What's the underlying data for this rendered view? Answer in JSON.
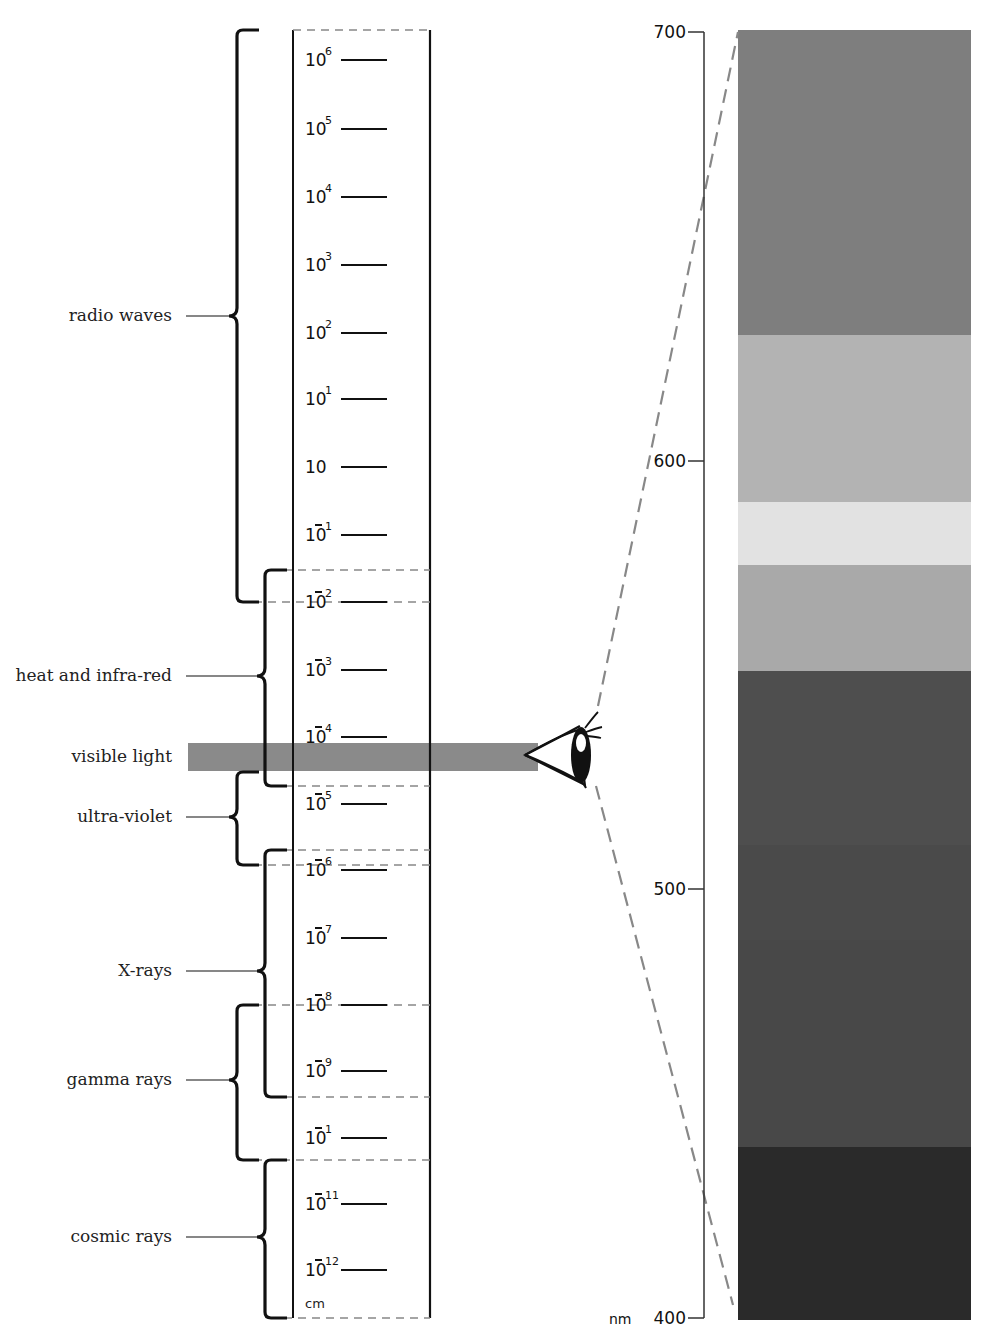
{
  "scale": {
    "unit": "cm",
    "ticks": [
      {
        "base": "10",
        "exp": "6",
        "neg": false,
        "y": 60
      },
      {
        "base": "10",
        "exp": "5",
        "neg": false,
        "y": 129
      },
      {
        "base": "10",
        "exp": "4",
        "neg": false,
        "y": 197
      },
      {
        "base": "10",
        "exp": "3",
        "neg": false,
        "y": 265
      },
      {
        "base": "10",
        "exp": "2",
        "neg": false,
        "y": 333
      },
      {
        "base": "10",
        "exp": "1",
        "neg": false,
        "y": 399
      },
      {
        "base": "10",
        "exp": "",
        "neg": false,
        "y": 467
      },
      {
        "base": "10",
        "exp": "1",
        "neg": true,
        "y": 535
      },
      {
        "base": "10",
        "exp": "2",
        "neg": true,
        "y": 602
      },
      {
        "base": "10",
        "exp": "3",
        "neg": true,
        "y": 670
      },
      {
        "base": "10",
        "exp": "4",
        "neg": true,
        "y": 737
      },
      {
        "base": "10",
        "exp": "5",
        "neg": true,
        "y": 804
      },
      {
        "base": "10",
        "exp": "6",
        "neg": true,
        "y": 870
      },
      {
        "base": "10",
        "exp": "7",
        "neg": true,
        "y": 938
      },
      {
        "base": "10",
        "exp": "8",
        "neg": true,
        "y": 1005
      },
      {
        "base": "10",
        "exp": "9",
        "neg": true,
        "y": 1071
      },
      {
        "base": "10",
        "exp": "1",
        "neg": true,
        "y": 1138
      },
      {
        "base": "10",
        "exp": "11",
        "neg": true,
        "y": 1204
      },
      {
        "base": "10",
        "exp": "12",
        "neg": true,
        "y": 1270
      }
    ]
  },
  "regions": [
    {
      "label": "radio waves",
      "top": 30,
      "bottom": 602,
      "mid": 316,
      "x": 237
    },
    {
      "label": "heat and infra-red",
      "top": 570,
      "bottom": 786,
      "mid": 676,
      "x": 265
    },
    {
      "label": "visible light",
      "y": 757
    },
    {
      "label": "ultra-violet",
      "top": 772,
      "bottom": 865,
      "mid": 817,
      "x": 237
    },
    {
      "label": "X-rays",
      "top": 850,
      "bottom": 1097,
      "mid": 971,
      "x": 265
    },
    {
      "label": "gamma rays",
      "top": 1005,
      "bottom": 1160,
      "mid": 1080,
      "x": 237
    },
    {
      "label": "cosmic rays",
      "top": 1160,
      "bottom": 1318,
      "mid": 1237,
      "x": 265
    }
  ],
  "wavelength_axis": {
    "unit": "nm",
    "ticks": [
      {
        "value": "700",
        "y": 32
      },
      {
        "value": "600",
        "y": 461
      },
      {
        "value": "500",
        "y": 889
      },
      {
        "value": "400",
        "y": 1318
      }
    ]
  },
  "spectrum_bands": [
    {
      "name": "red",
      "top": 30,
      "bottom": 335,
      "color": "#7e7e7e"
    },
    {
      "name": "orange",
      "top": 335,
      "bottom": 502,
      "color": "#b3b3b3"
    },
    {
      "name": "yellow",
      "top": 502,
      "bottom": 565,
      "color": "#e2e2e2"
    },
    {
      "name": "green",
      "top": 565,
      "bottom": 671,
      "color": "#a9a9a9"
    },
    {
      "name": "blue-green",
      "top": 671,
      "bottom": 845,
      "color": "#4e4e4e"
    },
    {
      "name": "blue",
      "top": 845,
      "bottom": 940,
      "color": "#4a4a4a"
    },
    {
      "name": "indigo",
      "top": 940,
      "bottom": 1147,
      "color": "#484848"
    },
    {
      "name": "violet",
      "top": 1147,
      "bottom": 1320,
      "color": "#2a2a2a"
    }
  ],
  "colors": {
    "visible_band": "#8a8a8a",
    "line": "#111111",
    "dash": "#8c8c8c"
  },
  "icons": {
    "eye": "eye-icon"
  }
}
